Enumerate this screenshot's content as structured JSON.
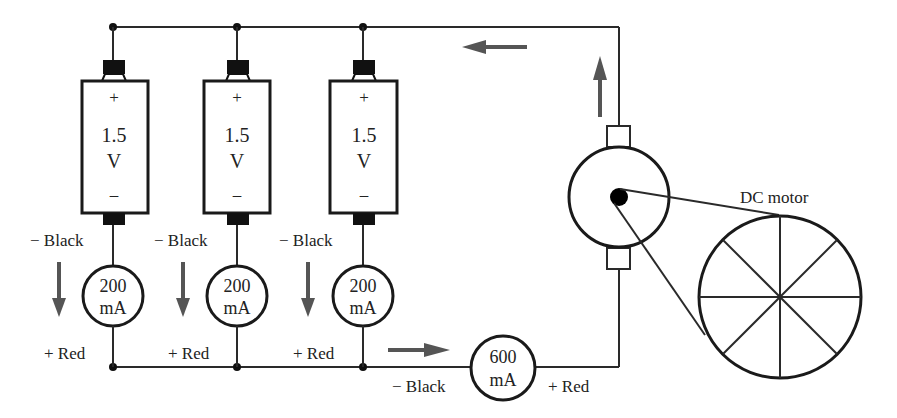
{
  "diagram": {
    "type": "parallel battery circuit driving DC motor",
    "batteries": [
      {
        "plus": "+",
        "voltage": "1.5",
        "unit": "V",
        "minus": "–"
      },
      {
        "plus": "+",
        "voltage": "1.5",
        "unit": "V",
        "minus": "–"
      },
      {
        "plus": "+",
        "voltage": "1.5",
        "unit": "V",
        "minus": "–"
      }
    ],
    "branch_meters": [
      {
        "value": "200",
        "unit": "mA",
        "neg_label": "− Black",
        "pos_label": "+ Red"
      },
      {
        "value": "200",
        "unit": "mA",
        "neg_label": "− Black",
        "pos_label": "+ Red"
      },
      {
        "value": "200",
        "unit": "mA",
        "neg_label": "− Black",
        "pos_label": "+ Red"
      }
    ],
    "total_meter": {
      "value": "600",
      "unit": "mA",
      "neg_label": "− Black",
      "pos_label": "+ Red"
    },
    "motor": {
      "label": "DC motor"
    },
    "colors": {
      "wire": "#2a2a2a",
      "arrow": "#555555",
      "background": "#ffffff"
    }
  }
}
